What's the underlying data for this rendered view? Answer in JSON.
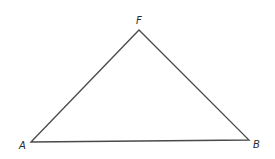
{
  "diagram": {
    "type": "triangle",
    "stroke_color": "#4a4a4a",
    "background": "#ffffff",
    "vertices": [
      {
        "name": "F",
        "x": 139,
        "y": 30,
        "label_x": 136,
        "label_y": 24
      },
      {
        "name": "A",
        "x": 31,
        "y": 142,
        "label_x": 19,
        "label_y": 149
      },
      {
        "name": "B",
        "x": 249,
        "y": 140,
        "label_x": 253,
        "label_y": 148
      }
    ],
    "labels": {
      "F": "F",
      "A": "A",
      "B": "B"
    }
  }
}
